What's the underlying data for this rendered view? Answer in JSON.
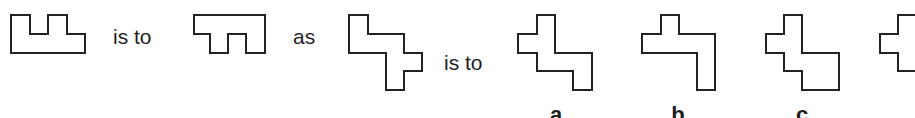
{
  "puzzle": {
    "connector_1": "is to",
    "connector_2": "as",
    "connector_3": "is to",
    "options": [
      {
        "label": "a"
      },
      {
        "label": "b"
      },
      {
        "label": "c"
      },
      {
        "label": "d"
      }
    ]
  },
  "colors": {
    "stroke": "#222222",
    "text": "#1e1e1e",
    "background": "#ffffff"
  },
  "shapes": {
    "shape_1": "11,15 30,15 30,34 48,34 48,15 67,15 67,34 85,34 85,53 11,53",
    "shape_2": "194,15 265,15 265,53 246,53 246,34 228,34 228,53 210,53 210,34 194,34",
    "shape_3": "349,15 368,15 368,34 404,34 404,53 422,53 422,71 404,71 404,90 386,90 386,53 349,53",
    "option_a": "537,15 555,15 555,53 592,53 592,90 573,90 573,71 537,71 537,53 518,53 518,34 537,34",
    "option_b": "661,15 679,15 679,34 715,34 715,90 697,90 697,53 642,53 642,34 661,34",
    "option_c": "784,15 802,15 802,53 839,53 839,90 802,90 802,71 784,71 784,53 766,53 766,34 784,34",
    "option_d_partial": "916,15 898,15 898,34 880,34 880,53 898,53 898,71 916,71"
  }
}
